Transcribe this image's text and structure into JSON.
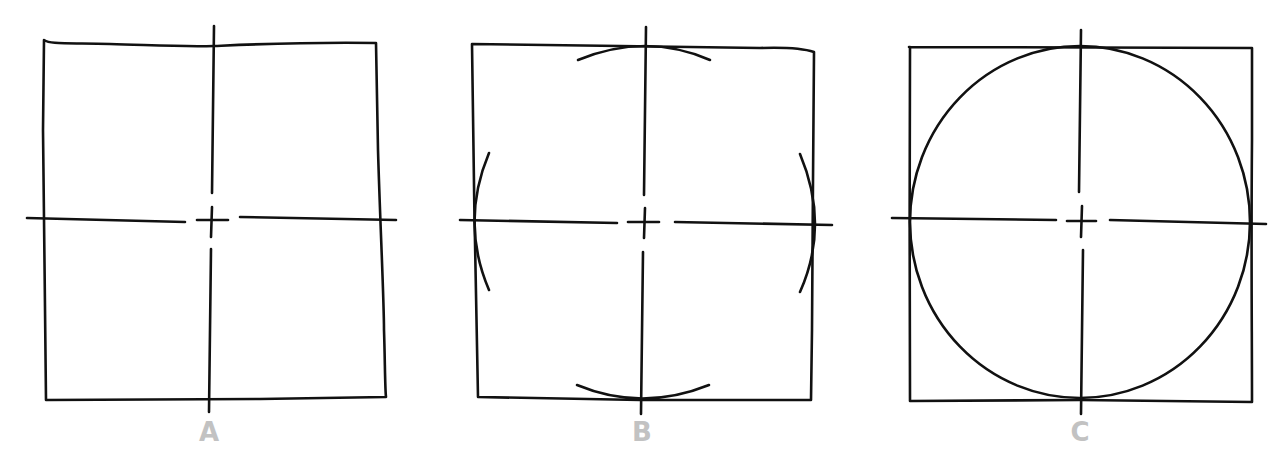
{
  "diagram": {
    "label_color": "#c2c2c2",
    "stroke_color": "#111111",
    "panels": [
      {
        "id": "A",
        "label": "A",
        "description": "Square divided by vertical and horizontal center lines with a center mark"
      },
      {
        "id": "B",
        "label": "B",
        "description": "Short arcs drawn at the four midpoints where center lines meet the square"
      },
      {
        "id": "C",
        "label": "C",
        "description": "Arcs joined into a full circle inscribed in the square"
      }
    ]
  }
}
